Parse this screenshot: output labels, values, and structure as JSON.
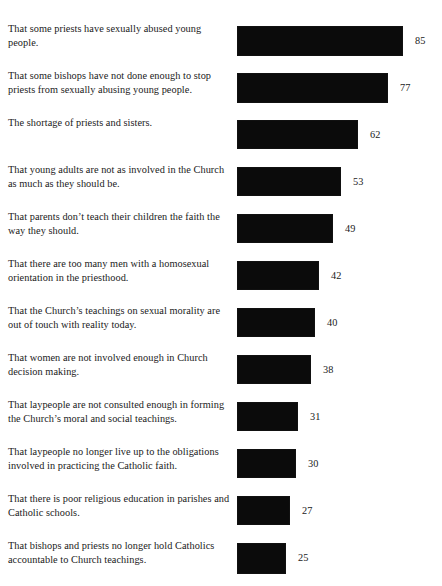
{
  "chart_data": {
    "type": "bar",
    "orientation": "horizontal",
    "title": "",
    "xlabel": "",
    "ylabel": "",
    "xlim": [
      0,
      85
    ],
    "grid": false,
    "legend": null,
    "value_labels": true,
    "units": "percent",
    "categories": [
      "That some priests have sexually abused young people.",
      "That some bishops have not done enough to stop priests from sexually abusing young people.",
      "The shortage of priests and sisters.",
      "That young adults are not as involved in the Church as much as they should be.",
      "That parents don’t teach their children the faith the way they should.",
      "That there are too many men with a homosexual orientation in the priesthood.",
      "That the Church’s teachings on sexual morality are out of touch with reality today.",
      "That women are not involved enough in Church decision making.",
      "That laypeople are not consulted enough in forming the Church’s moral and social teachings.",
      "That laypeople no longer live up to the obligations involved in practicing the Catholic faith.",
      "That there is poor religious education in parishes and Catholic schools.",
      "That bishops and priests no longer hold Catholics accountable to Church teachings."
    ],
    "values": [
      85,
      77,
      62,
      53,
      49,
      42,
      40,
      38,
      31,
      30,
      27,
      25
    ],
    "value_strings": [
      "85",
      "77",
      "62",
      "53",
      "49",
      "42",
      "40",
      "38",
      "31",
      "30",
      "27",
      "25"
    ],
    "bar_color": "#0b0b0b",
    "background_color": "#ffffff"
  },
  "rows": [
    {
      "label": "That some priests have sexually abused young people.",
      "value": 85,
      "value_text": "85"
    },
    {
      "label": "That some bishops have not done enough to stop priests from sexually abusing young people.",
      "value": 77,
      "value_text": "77"
    },
    {
      "label": "The shortage of priests and sisters.",
      "value": 62,
      "value_text": "62"
    },
    {
      "label": "That young adults are not as involved in the Church as much as they should be.",
      "value": 53,
      "value_text": "53"
    },
    {
      "label": "That parents don’t teach their children the faith the way they should.",
      "value": 49,
      "value_text": "49"
    },
    {
      "label": "That there are too many men with a homosexual orientation in the priesthood.",
      "value": 42,
      "value_text": "42"
    },
    {
      "label": "That the Church’s teachings on sexual morality are out of touch with reality today.",
      "value": 40,
      "value_text": "40"
    },
    {
      "label": "That women are not involved enough in Church decision making.",
      "value": 38,
      "value_text": "38"
    },
    {
      "label": "That laypeople are not consulted enough in forming the Church’s moral and social teachings.",
      "value": 31,
      "value_text": "31"
    },
    {
      "label": "That laypeople no longer live up to the obligations involved in practicing the Catholic faith.",
      "value": 30,
      "value_text": "30"
    },
    {
      "label": "That there is poor religious education in parishes and Catholic schools.",
      "value": 27,
      "value_text": "27"
    },
    {
      "label": "That bishops and priests no longer hold Catholics accountable to Church teachings.",
      "value": 25,
      "value_text": "25"
    }
  ]
}
